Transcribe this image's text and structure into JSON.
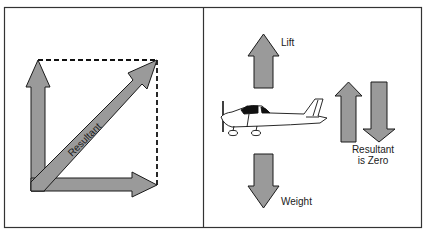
{
  "figure": {
    "colors": {
      "arrow_fill": "#9a9a9a",
      "arrow_stroke": "#1a1a1a",
      "frame": "#333333",
      "background": "#ffffff"
    }
  },
  "left_panel": {
    "resultant_label": "Resultant",
    "vectors": [
      {
        "name": "vertical-component",
        "direction": "up"
      },
      {
        "name": "horizontal-component",
        "direction": "right"
      },
      {
        "name": "resultant",
        "direction": "diagonal-up-right"
      }
    ]
  },
  "right_panel": {
    "lift_label": "Lift",
    "weight_label": "Weight",
    "resultant_label_line1": "Resultant",
    "resultant_label_line2": "is Zero"
  }
}
